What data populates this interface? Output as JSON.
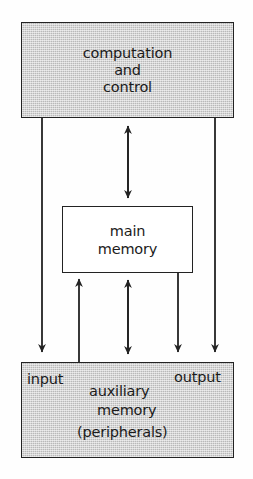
{
  "diagram": {
    "background_color": "#ffffff",
    "shade_color": "#b9b9b9",
    "line_color": "#232323",
    "nodes": {
      "computation": {
        "line1": "computation",
        "line2": "and",
        "line3": "control",
        "fill": "shaded"
      },
      "main_memory": {
        "line1": "main",
        "line2": "memory",
        "fill": "white"
      },
      "auxiliary": {
        "input": "input",
        "output": "output",
        "line1": "auxiliary",
        "line2": "memory",
        "line3": "(peripherals)",
        "fill": "shaded"
      }
    },
    "connectors": [
      {
        "name": "computation-to-auxiliary-left",
        "direction": "down",
        "x": 42
      },
      {
        "name": "auxiliary-to-main-memory-left",
        "direction": "up",
        "x": 79
      },
      {
        "name": "computation-main-memory-bidirectional",
        "direction": "both",
        "x": 128
      },
      {
        "name": "main-memory-auxiliary-bidirectional",
        "direction": "both",
        "x": 128
      },
      {
        "name": "main-memory-to-auxiliary-right",
        "direction": "down",
        "x": 178
      },
      {
        "name": "computation-to-auxiliary-right",
        "direction": "down",
        "x": 215
      }
    ]
  }
}
